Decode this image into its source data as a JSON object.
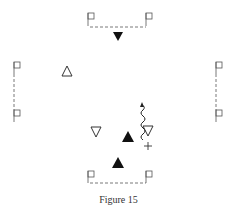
{
  "figure": {
    "caption": "Figure 15",
    "colors": {
      "ink": "#222222",
      "goal_lines": "#555555",
      "background": "#ffffff"
    },
    "goals": [
      {
        "id": "top",
        "orientation": "horizontal",
        "flag_left": [
          88,
          13
        ],
        "flag_right": [
          146,
          13
        ]
      },
      {
        "id": "bottom",
        "orientation": "horizontal",
        "flag_left": [
          88,
          171
        ],
        "flag_right": [
          146,
          171
        ]
      },
      {
        "id": "left",
        "orientation": "vertical",
        "flag_top": [
          14,
          62
        ],
        "flag_bottom": [
          14,
          110
        ]
      },
      {
        "id": "right",
        "orientation": "vertical",
        "flag_top": [
          216,
          62
        ],
        "flag_bottom": [
          216,
          110
        ]
      }
    ],
    "players": [
      {
        "symbol": "filled-triangle-down",
        "position": [
          118,
          36
        ]
      },
      {
        "symbol": "open-triangle-up",
        "position": [
          67,
          71
        ]
      },
      {
        "symbol": "open-triangle-down",
        "position": [
          96,
          132
        ]
      },
      {
        "symbol": "filled-triangle-up",
        "position": [
          128,
          137
        ]
      },
      {
        "symbol": "open-triangle-down",
        "position": [
          148,
          131
        ]
      },
      {
        "symbol": "filled-triangle-up",
        "position": [
          118,
          163
        ]
      }
    ],
    "markers": [
      {
        "symbol": "plus",
        "position": [
          148,
          146
        ]
      },
      {
        "symbol": "wavy-arrow",
        "from": [
          143,
          140
        ],
        "to": [
          142,
          103
        ]
      }
    ]
  }
}
